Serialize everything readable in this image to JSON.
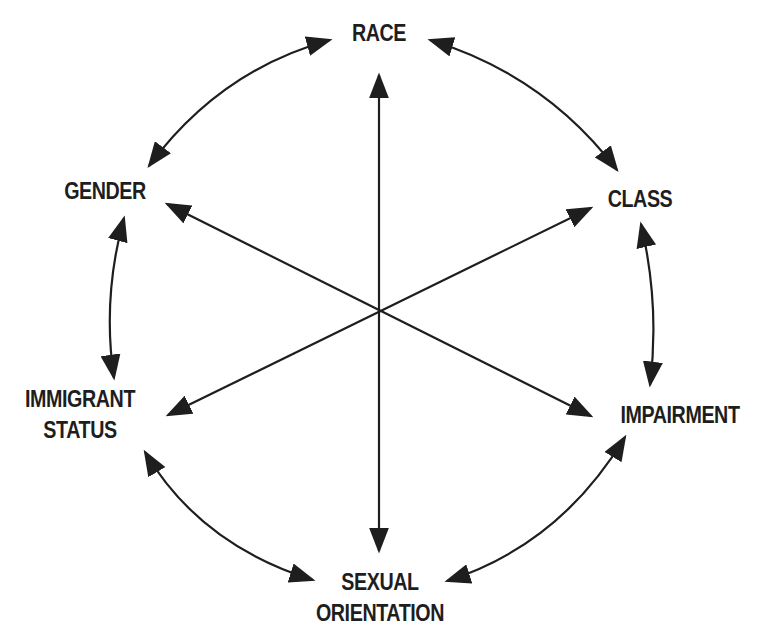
{
  "diagram": {
    "type": "hub-and-spoke with circular bidirectional links",
    "colors": {
      "line": "#1e1e1e",
      "text": "#1e1e1e",
      "background": "#ffffff"
    },
    "center": {
      "x": 379,
      "y": 311
    },
    "nodes": [
      {
        "id": "race",
        "lines": [
          "RACE"
        ]
      },
      {
        "id": "class",
        "lines": [
          "CLASS"
        ]
      },
      {
        "id": "impairment",
        "lines": [
          "IMPAIRMENT"
        ]
      },
      {
        "id": "sexual-orientation",
        "lines": [
          "SEXUAL",
          "ORIENTATION"
        ]
      },
      {
        "id": "immigrant-status",
        "lines": [
          "IMMIGRANT",
          "STATUS"
        ]
      },
      {
        "id": "gender",
        "lines": [
          "GENDER"
        ]
      }
    ],
    "edges": {
      "spokes": [
        {
          "from": "race",
          "to": "sexual-orientation",
          "bidirectional": true
        },
        {
          "from": "gender",
          "to": "impairment",
          "bidirectional": true
        },
        {
          "from": "class",
          "to": "immigrant-status",
          "bidirectional": true
        }
      ],
      "ring": [
        {
          "from": "race",
          "to": "class",
          "bidirectional": true
        },
        {
          "from": "class",
          "to": "impairment",
          "bidirectional": true
        },
        {
          "from": "impairment",
          "to": "sexual-orientation",
          "bidirectional": true
        },
        {
          "from": "sexual-orientation",
          "to": "immigrant-status",
          "bidirectional": true
        },
        {
          "from": "immigrant-status",
          "to": "gender",
          "bidirectional": true
        },
        {
          "from": "gender",
          "to": "race",
          "bidirectional": true
        }
      ]
    }
  }
}
